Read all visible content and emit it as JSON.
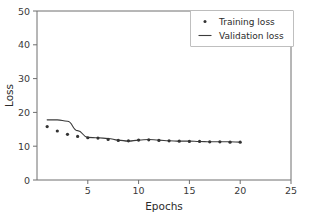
{
  "chart_data": {
    "type": "line",
    "title": "",
    "xlabel": "Epochs",
    "ylabel": "Loss",
    "xlim": [
      0,
      25
    ],
    "ylim": [
      0,
      50
    ],
    "xticks": [
      5,
      10,
      15,
      20,
      25
    ],
    "yticks": [
      0,
      10,
      20,
      30,
      40,
      50
    ],
    "grid": false,
    "legend_position": "upper right",
    "series": [
      {
        "name": "Training loss",
        "style": "scatter",
        "marker": "dot",
        "color": "#333333",
        "x": [
          1,
          2,
          3,
          4,
          5,
          6,
          7,
          8,
          9,
          10,
          11,
          12,
          13,
          14,
          15,
          16,
          17,
          18,
          19,
          20
        ],
        "values": [
          15.8,
          14.5,
          13.5,
          12.9,
          12.5,
          12.4,
          12.0,
          11.7,
          11.6,
          11.8,
          11.9,
          11.7,
          11.6,
          11.5,
          11.4,
          11.4,
          11.3,
          11.3,
          11.2,
          11.2
        ]
      },
      {
        "name": "Validation loss",
        "style": "line",
        "color": "#3b3b3b",
        "x": [
          1,
          2,
          3,
          4,
          5,
          6,
          7,
          8,
          9,
          10,
          11,
          12,
          13,
          14,
          15,
          16,
          17,
          18,
          19,
          20
        ],
        "values": [
          17.8,
          17.8,
          17.4,
          14.6,
          12.6,
          12.5,
          12.3,
          11.8,
          11.5,
          11.8,
          12.0,
          11.8,
          11.6,
          11.5,
          11.5,
          11.4,
          11.3,
          11.3,
          11.3,
          11.2
        ]
      }
    ],
    "legend": [
      {
        "label": "Training loss",
        "marker": "dot"
      },
      {
        "label": "Validation loss",
        "marker": "line"
      }
    ]
  },
  "axis": {
    "y_tick_labels": [
      "0",
      "10",
      "20",
      "30",
      "40",
      "50"
    ],
    "x_tick_labels": [
      "5",
      "10",
      "15",
      "20",
      "25"
    ],
    "x_title": "Epochs",
    "y_title": "Loss"
  },
  "legend": {
    "training_label": "Training loss",
    "validation_label": "Validation loss"
  },
  "colors": {
    "series_training": "#333333",
    "series_validation": "#3b3b3b",
    "spine": "#6e6e6e",
    "legend_border": "#b8b8b8",
    "background": "#ffffff"
  }
}
